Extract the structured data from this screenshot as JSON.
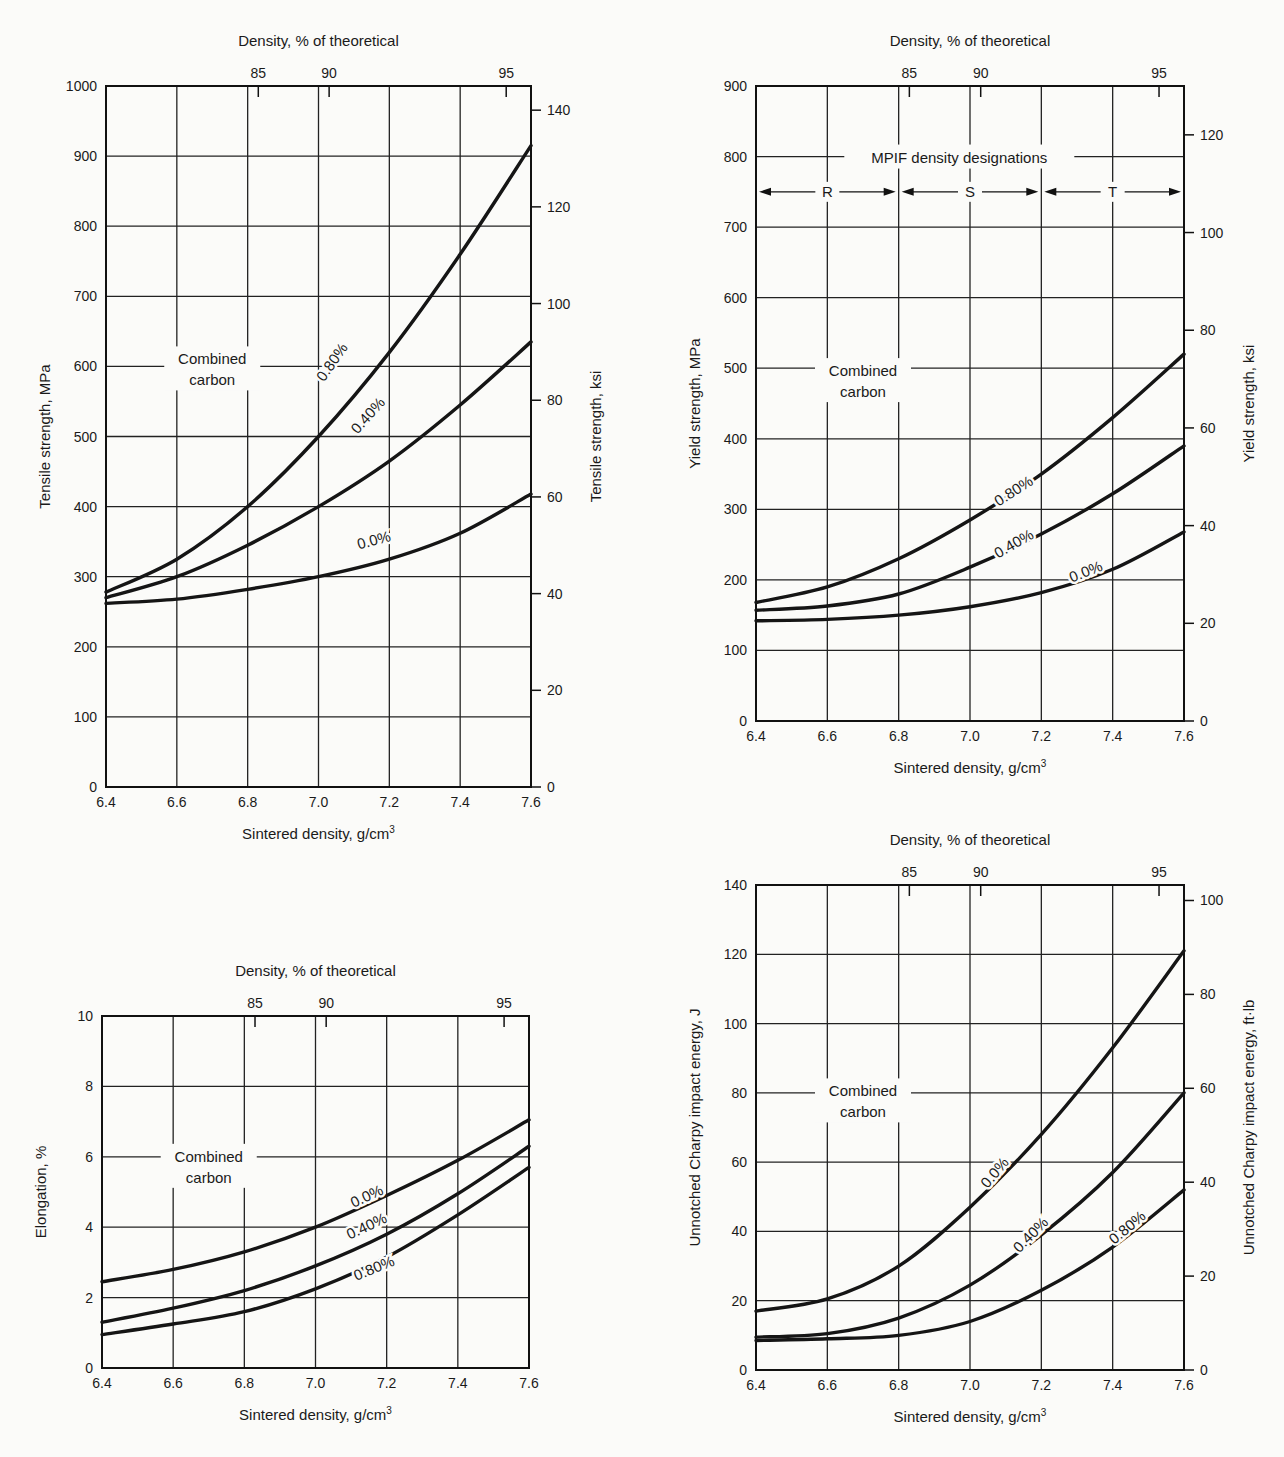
{
  "chart_data": [
    {
      "id": "tensile",
      "type": "line",
      "title": "",
      "top_axis_label": "Density, % of theoretical",
      "top_ticks": [
        "85",
        "90",
        "95"
      ],
      "top_tick_x": [
        6.83,
        7.03,
        7.53
      ],
      "xlabel": "Sintered density, g/cm³",
      "ylabel": "Tensile strength, MPa",
      "ylabel_right": "Tensile strength, ksi",
      "xlim": [
        6.4,
        7.6
      ],
      "ylim": [
        0,
        1000
      ],
      "x_ticks": [
        "6.4",
        "6.6",
        "6.8",
        "7.0",
        "7.2",
        "7.4",
        "7.6"
      ],
      "y_ticks": [
        "0",
        "100",
        "200",
        "300",
        "400",
        "500",
        "600",
        "700",
        "800",
        "900",
        "1000"
      ],
      "y_ticks_right": [
        "0",
        "20",
        "40",
        "60",
        "80",
        "100",
        "120",
        "140"
      ],
      "right_scale_max": 145,
      "legend_title": "Combined carbon",
      "legend_title_lines": [
        "Combined",
        "carbon"
      ],
      "grid": true,
      "x": [
        6.4,
        6.6,
        6.8,
        7.0,
        7.2,
        7.4,
        7.6
      ],
      "series": [
        {
          "name": "0.80%",
          "values": [
            278,
            325,
            400,
            500,
            620,
            760,
            915
          ],
          "label_at": [
            7.05,
            602,
            -55
          ]
        },
        {
          "name": "0.40%",
          "values": [
            270,
            300,
            345,
            400,
            465,
            545,
            635
          ],
          "label_at": [
            7.15,
            525,
            -48
          ]
        },
        {
          "name": "0.0%",
          "values": [
            262,
            268,
            282,
            300,
            325,
            362,
            418
          ],
          "label_at": [
            7.16,
            345,
            -15
          ]
        }
      ]
    },
    {
      "id": "yield",
      "type": "line",
      "title": "",
      "top_axis_label": "Density, % of theoretical",
      "top_ticks": [
        "85",
        "90",
        "95"
      ],
      "top_tick_x": [
        6.83,
        7.03,
        7.53
      ],
      "xlabel": "Sintered density, g/cm³",
      "ylabel": "Yield strength, MPa",
      "ylabel_right": "Yield strength, ksi",
      "xlim": [
        6.4,
        7.6
      ],
      "ylim": [
        0,
        900
      ],
      "x_ticks": [
        "6.4",
        "6.6",
        "6.8",
        "7.0",
        "7.2",
        "7.4",
        "7.6"
      ],
      "y_ticks": [
        "0",
        "100",
        "200",
        "300",
        "400",
        "500",
        "600",
        "700",
        "800",
        "900"
      ],
      "y_ticks_right": [
        "0",
        "20",
        "40",
        "60",
        "80",
        "100",
        "120"
      ],
      "right_scale_max": 130,
      "legend_title": "Combined carbon",
      "legend_title_lines": [
        "Combined",
        "carbon"
      ],
      "annotation": "MPIF density designations",
      "density_designations": [
        "R",
        "S",
        "T"
      ],
      "grid": true,
      "x": [
        6.4,
        6.6,
        6.8,
        7.0,
        7.2,
        7.4,
        7.6
      ],
      "series": [
        {
          "name": "0.80%",
          "values": [
            168,
            190,
            230,
            285,
            350,
            430,
            520
          ],
          "label_at": [
            7.13,
            320,
            -33
          ]
        },
        {
          "name": "0.40%",
          "values": [
            157,
            163,
            180,
            218,
            265,
            322,
            390
          ],
          "label_at": [
            7.13,
            245,
            -30
          ]
        },
        {
          "name": "0.0%",
          "values": [
            142,
            144,
            150,
            162,
            182,
            215,
            268
          ],
          "label_at": [
            7.33,
            205,
            -22
          ]
        }
      ]
    },
    {
      "id": "elongation",
      "type": "line",
      "title": "",
      "top_axis_label": "Density, % of theoretical",
      "top_ticks": [
        "85",
        "90",
        "95"
      ],
      "top_tick_x": [
        6.83,
        7.03,
        7.53
      ],
      "xlabel": "Sintered density, g/cm³",
      "ylabel": "Elongation, %",
      "xlim": [
        6.4,
        7.6
      ],
      "ylim": [
        0,
        10
      ],
      "x_ticks": [
        "6.4",
        "6.6",
        "6.8",
        "7.0",
        "7.2",
        "7.4",
        "7.6"
      ],
      "y_ticks": [
        "0",
        "2",
        "4",
        "6",
        "8",
        "10"
      ],
      "legend_title": "Combined carbon",
      "legend_title_lines": [
        "Combined",
        "carbon"
      ],
      "grid": true,
      "x": [
        6.4,
        6.6,
        6.8,
        7.0,
        7.2,
        7.4,
        7.6
      ],
      "series": [
        {
          "name": "0.0%",
          "values": [
            2.45,
            2.8,
            3.3,
            4.0,
            4.9,
            5.9,
            7.05
          ],
          "label_at": [
            7.15,
            4.75,
            -25
          ]
        },
        {
          "name": "0.40%",
          "values": [
            1.3,
            1.7,
            2.2,
            2.9,
            3.8,
            4.95,
            6.3
          ],
          "label_at": [
            7.15,
            3.9,
            -25
          ]
        },
        {
          "name": "0.80%",
          "values": [
            0.95,
            1.25,
            1.6,
            2.25,
            3.15,
            4.35,
            5.7
          ],
          "label_at": [
            7.17,
            2.7,
            -22
          ]
        }
      ]
    },
    {
      "id": "charpy",
      "type": "line",
      "title": "",
      "top_axis_label": "Density, % of theoretical",
      "top_ticks": [
        "85",
        "90",
        "95"
      ],
      "top_tick_x": [
        6.83,
        7.03,
        7.53
      ],
      "xlabel": "Sintered density, g/cm³",
      "ylabel": "Unnotched Charpy impact energy, J",
      "ylabel_right": "Unnotched Charpy impact energy, ft·lb",
      "xlim": [
        6.4,
        7.6
      ],
      "ylim": [
        0,
        140
      ],
      "x_ticks": [
        "6.4",
        "6.6",
        "6.8",
        "7.0",
        "7.2",
        "7.4",
        "7.6"
      ],
      "y_ticks": [
        "0",
        "20",
        "40",
        "60",
        "80",
        "100",
        "120",
        "140"
      ],
      "y_ticks_right": [
        "0",
        "20",
        "40",
        "60",
        "80",
        "100"
      ],
      "right_scale_max": 103.3,
      "legend_title": "Combined carbon",
      "legend_title_lines": [
        "Combined",
        "carbon"
      ],
      "grid": true,
      "x": [
        6.4,
        6.6,
        6.8,
        7.0,
        7.2,
        7.4,
        7.6
      ],
      "series": [
        {
          "name": "0.0%",
          "values": [
            17,
            20.5,
            30,
            47,
            68,
            93,
            121
          ],
          "label_at": [
            7.08,
            56,
            -50
          ]
        },
        {
          "name": "0.40%",
          "values": [
            9.5,
            10.5,
            15,
            24.5,
            39,
            57,
            80
          ],
          "label_at": [
            7.18,
            38,
            -45
          ]
        },
        {
          "name": "0.80%",
          "values": [
            8.5,
            9,
            10,
            14,
            23,
            35.5,
            52
          ],
          "label_at": [
            7.45,
            40,
            -40
          ]
        }
      ]
    }
  ],
  "page": {
    "charts": [
      {
        "top_label": "Density, % of theoretical",
        "x_label": "Sintered density, g/cm³",
        "left_label": "Tensile strength, MPa",
        "right_label": "Tensile strength, ksi"
      },
      {
        "top_label": "Density, % of theoretical",
        "x_label": "Sintered density, g/cm³",
        "left_label": "Yield strength, MPa",
        "right_label": "Yield strength, ksi"
      },
      {
        "top_label": "Density, % of theoretical",
        "x_label": "Sintered density, g/cm³",
        "left_label": "Elongation, %",
        "right_label": ""
      },
      {
        "top_label": "Density, % of theoretical",
        "x_label": "Sintered density, g/cm³",
        "left_label": "Unnotched Charpy impact energy, J",
        "right_label": "Unnotched Charpy impact energy, ft·lb"
      }
    ]
  }
}
